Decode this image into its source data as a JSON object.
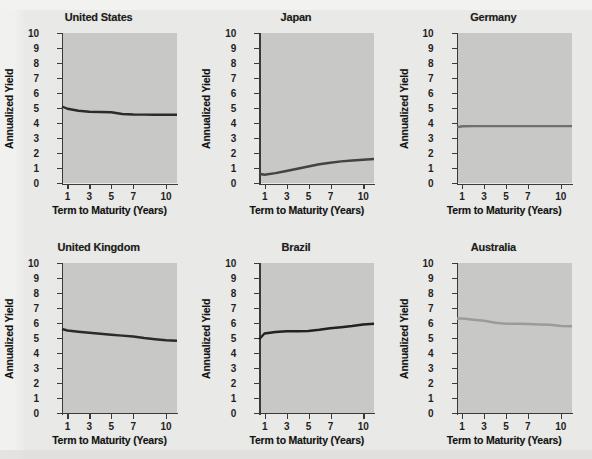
{
  "figure": {
    "background_color": "#e9e9e7",
    "plot_background_color": "#c8c8c6",
    "axis_color": "#3a3a3a",
    "layout": {
      "rows": 2,
      "cols": 3
    }
  },
  "common": {
    "ylabel": "Annualized Yield",
    "xlabel": "Term to Maturity (Years)",
    "yticks": [
      "0",
      "1",
      "2",
      "3",
      "4",
      "5",
      "6",
      "7",
      "8",
      "9",
      "10"
    ],
    "xticks": [
      "1",
      "3",
      "5",
      "7",
      "10"
    ]
  },
  "chart_data": [
    {
      "type": "line",
      "title": "United States",
      "xlabel": "Term to Maturity (Years)",
      "ylabel": "Annualized Yield",
      "ylim": [
        0,
        10
      ],
      "xlim": [
        0.5,
        11
      ],
      "xtick_values": [
        1,
        3,
        5,
        7,
        10
      ],
      "xtick_labels": [
        "1",
        "3",
        "5",
        "7",
        "10"
      ],
      "ytick_values": [
        0,
        1,
        2,
        3,
        4,
        5,
        6,
        7,
        8,
        9,
        10
      ],
      "grid": false,
      "legend": "none",
      "line_color": "#2b2b2b",
      "x": [
        0.5,
        1,
        2,
        3,
        4,
        5,
        6,
        7,
        8,
        9,
        10,
        11
      ],
      "y": [
        5.1,
        4.95,
        4.82,
        4.75,
        4.73,
        4.72,
        4.6,
        4.57,
        4.56,
        4.55,
        4.55,
        4.55
      ]
    },
    {
      "type": "line",
      "title": "Japan",
      "xlabel": "Term to Maturity (Years)",
      "ylabel": "Annualized Yield",
      "ylim": [
        0,
        10
      ],
      "xlim": [
        0.5,
        11
      ],
      "xtick_values": [
        1,
        3,
        5,
        7,
        10
      ],
      "xtick_labels": [
        "1",
        "3",
        "5",
        "7",
        "10"
      ],
      "ytick_values": [
        0,
        1,
        2,
        3,
        4,
        5,
        6,
        7,
        8,
        9,
        10
      ],
      "grid": false,
      "legend": "none",
      "line_color": "#434343",
      "x": [
        0.5,
        1,
        2,
        3,
        4,
        5,
        6,
        7,
        8,
        9,
        10,
        11
      ],
      "y": [
        0.62,
        0.55,
        0.66,
        0.8,
        0.95,
        1.1,
        1.25,
        1.35,
        1.44,
        1.5,
        1.55,
        1.6
      ]
    },
    {
      "type": "line",
      "title": "Germany",
      "xlabel": "Term to Maturity (Years)",
      "ylabel": "Annualized Yield",
      "ylim": [
        0,
        10
      ],
      "xlim": [
        0.5,
        11
      ],
      "xtick_values": [
        1,
        3,
        5,
        7,
        10
      ],
      "xtick_labels": [
        "1",
        "3",
        "5",
        "7",
        "10"
      ],
      "ytick_values": [
        0,
        1,
        2,
        3,
        4,
        5,
        6,
        7,
        8,
        9,
        10
      ],
      "grid": false,
      "legend": "none",
      "line_color": "#6f6f6f",
      "x": [
        0.5,
        1,
        2,
        3,
        4,
        5,
        6,
        7,
        8,
        9,
        10,
        11
      ],
      "y": [
        3.72,
        3.78,
        3.79,
        3.79,
        3.79,
        3.79,
        3.79,
        3.79,
        3.79,
        3.79,
        3.79,
        3.79
      ]
    },
    {
      "type": "line",
      "title": "United Kingdom",
      "xlabel": "Term to Maturity (Years)",
      "ylabel": "Annualized Yield",
      "ylim": [
        0,
        10
      ],
      "xlim": [
        0.5,
        11
      ],
      "xtick_values": [
        1,
        3,
        5,
        7,
        10
      ],
      "xtick_labels": [
        "1",
        "3",
        "5",
        "7",
        "10"
      ],
      "ytick_values": [
        0,
        1,
        2,
        3,
        4,
        5,
        6,
        7,
        8,
        9,
        10
      ],
      "grid": false,
      "legend": "none",
      "line_color": "#2b2b2b",
      "x": [
        0.5,
        1,
        2,
        3,
        4,
        5,
        6,
        7,
        8,
        9,
        10,
        11
      ],
      "y": [
        5.6,
        5.5,
        5.42,
        5.35,
        5.28,
        5.22,
        5.16,
        5.1,
        5.0,
        4.92,
        4.85,
        4.82
      ]
    },
    {
      "type": "line",
      "title": "Brazil",
      "xlabel": "Term to Maturity (Years)",
      "ylabel": "Annualized Yield",
      "ylim": [
        0,
        10
      ],
      "xlim": [
        0.5,
        11
      ],
      "xtick_values": [
        1,
        3,
        5,
        7,
        10
      ],
      "xtick_labels": [
        "1",
        "3",
        "5",
        "7",
        "10"
      ],
      "ytick_values": [
        0,
        1,
        2,
        3,
        4,
        5,
        6,
        7,
        8,
        9,
        10
      ],
      "grid": false,
      "legend": "none",
      "line_color": "#222222",
      "x": [
        0.5,
        1,
        2,
        3,
        4,
        5,
        6,
        7,
        8,
        9,
        10,
        11
      ],
      "y": [
        4.9,
        5.3,
        5.4,
        5.45,
        5.45,
        5.47,
        5.55,
        5.65,
        5.72,
        5.8,
        5.9,
        5.95
      ]
    },
    {
      "type": "line",
      "title": "Australia",
      "xlabel": "Term to Maturity (Years)",
      "ylabel": "Annualized Yield",
      "ylim": [
        0,
        10
      ],
      "xlim": [
        0.5,
        11
      ],
      "xtick_values": [
        1,
        3,
        5,
        7,
        10
      ],
      "xtick_labels": [
        "1",
        "3",
        "5",
        "7",
        "10"
      ],
      "ytick_values": [
        0,
        1,
        2,
        3,
        4,
        5,
        6,
        7,
        8,
        9,
        10
      ],
      "grid": false,
      "legend": "none",
      "line_color": "#9b9b9b",
      "x": [
        0.5,
        1,
        2,
        3,
        4,
        5,
        6,
        7,
        8,
        9,
        10,
        11
      ],
      "y": [
        6.3,
        6.3,
        6.22,
        6.15,
        6.02,
        5.95,
        5.95,
        5.93,
        5.9,
        5.88,
        5.8,
        5.78
      ]
    }
  ]
}
